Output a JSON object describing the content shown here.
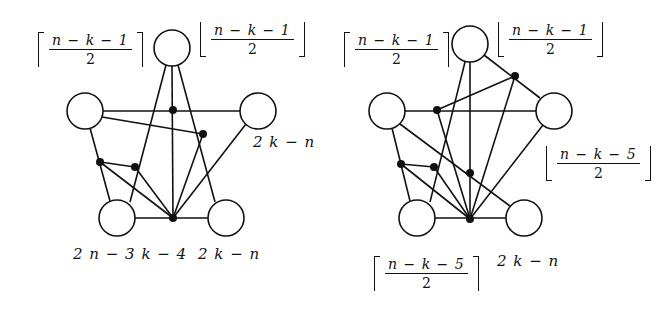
{
  "figures": [
    {
      "id": "left",
      "labels": {
        "top_left": {
          "num": "n − k − 1",
          "den": "2",
          "bracket": "ceil"
        },
        "top_right": {
          "num": "n − k − 1",
          "den": "2",
          "bracket": "floor"
        },
        "right": "2 k − n",
        "bottom_left": "2 n − 3 k − 4",
        "bottom_right": "2 k − n"
      },
      "circles": [
        {
          "name": "top",
          "cx": 172,
          "cy": 48
        },
        {
          "name": "left",
          "cx": 85,
          "cy": 111
        },
        {
          "name": "right",
          "cx": 258,
          "cy": 111
        },
        {
          "name": "bottom-left",
          "cx": 117,
          "cy": 218
        },
        {
          "name": "bottom-right",
          "cx": 226,
          "cy": 218
        }
      ],
      "dots": [
        {
          "name": "a",
          "x": 173,
          "y": 110
        },
        {
          "name": "b",
          "x": 203,
          "y": 134
        },
        {
          "name": "c",
          "x": 100,
          "y": 162
        },
        {
          "name": "d",
          "x": 135,
          "y": 167
        },
        {
          "name": "hub",
          "x": 173,
          "y": 218
        }
      ]
    },
    {
      "id": "right",
      "labels": {
        "top_left": {
          "num": "n − k − 1",
          "den": "2",
          "bracket": "ceil"
        },
        "top_right": {
          "num": "n − k − 1",
          "den": "2",
          "bracket": "floor"
        },
        "right": {
          "num": "n − k − 5",
          "den": "2",
          "bracket": "floor"
        },
        "bottom_left": {
          "num": "n − k − 5",
          "den": "2",
          "bracket": "ceil"
        },
        "bottom_right": "2 k − n"
      },
      "circles": [
        {
          "name": "top",
          "cx": 470,
          "cy": 44
        },
        {
          "name": "left",
          "cx": 387,
          "cy": 111
        },
        {
          "name": "right",
          "cx": 554,
          "cy": 111
        },
        {
          "name": "bottom-left",
          "cx": 417,
          "cy": 218
        },
        {
          "name": "bottom-right",
          "cx": 524,
          "cy": 218
        }
      ],
      "dots": [
        {
          "name": "p",
          "x": 515,
          "y": 76
        },
        {
          "name": "q",
          "x": 437,
          "y": 110
        },
        {
          "name": "r",
          "x": 401,
          "y": 164
        },
        {
          "name": "s",
          "x": 434,
          "y": 167
        },
        {
          "name": "t",
          "x": 470,
          "y": 173
        },
        {
          "name": "hub",
          "x": 470,
          "y": 219
        }
      ]
    }
  ]
}
